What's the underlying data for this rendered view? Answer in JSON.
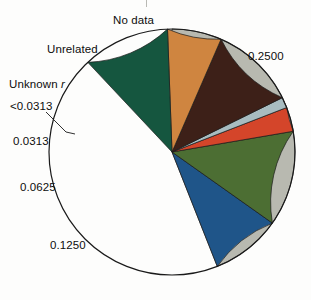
{
  "figure": {
    "background_color": "#fdfdfc",
    "outline_color": "#1a1a1a",
    "label_color": "#0d0d0d"
  },
  "labels": {
    "no_data": "No data",
    "unrelated": "Unrelated",
    "unknown_r_prefix": "Unknown ",
    "unknown_r_symbol": "r",
    "lt_0313": "<0.0313",
    "v_0313": "0.0313",
    "v_0625": "0.0625",
    "v_1250": "0.1250",
    "v_2500": "0.2500"
  },
  "chart_data": {
    "type": "pie",
    "title": "",
    "subtitle": "",
    "xlabel": "",
    "ylabel": "",
    "grid": false,
    "legend_position": "none",
    "labels_placement": "outside-with-leader-lines",
    "start_angle_deg": 90,
    "direction": "counterclockwise",
    "total": 1.0,
    "center": {
      "cx": 172,
      "cy": 152
    },
    "radius": 123,
    "slices": [
      {
        "label": "0.2500",
        "value": 0.44,
        "percent": 44.0,
        "color": "#b8b9b0",
        "start_angle_deg": 90,
        "end_angle_deg": -68.4
      },
      {
        "label": "0.1250",
        "value": 0.092,
        "percent": 9.2,
        "color": "#1f5589",
        "start_angle_deg": -68.4,
        "end_angle_deg": -35.3
      },
      {
        "label": "0.0625",
        "value": 0.125,
        "percent": 12.5,
        "color": "#4c6e33",
        "start_angle_deg": -35.3,
        "end_angle_deg": 9.7
      },
      {
        "label": "0.0313",
        "value": 0.032,
        "percent": 3.2,
        "color": "#d4452a",
        "start_angle_deg": 9.7,
        "end_angle_deg": 21.2
      },
      {
        "label": "<0.0313",
        "value": 0.014,
        "percent": 1.4,
        "color": "#a8bcc0",
        "start_angle_deg": 21.2,
        "end_angle_deg": 26.2
      },
      {
        "label": "Unknown r",
        "value": 0.112,
        "percent": 11.2,
        "color": "#3d2018",
        "start_angle_deg": 26.2,
        "end_angle_deg": 66.5
      },
      {
        "label": "Unrelated",
        "value": 0.071,
        "percent": 7.1,
        "color": "#cf8540",
        "start_angle_deg": 66.5,
        "end_angle_deg": 92.1
      },
      {
        "label": "No data",
        "value": 0.114,
        "percent": 11.4,
        "color": "#15563f",
        "start_angle_deg": 92.1,
        "end_angle_deg": 133.2
      }
    ],
    "colors": [
      "#b8b9b0",
      "#1f5589",
      "#4c6e33",
      "#d4452a",
      "#a8bcc0",
      "#3d2018",
      "#cf8540",
      "#15563f"
    ]
  }
}
